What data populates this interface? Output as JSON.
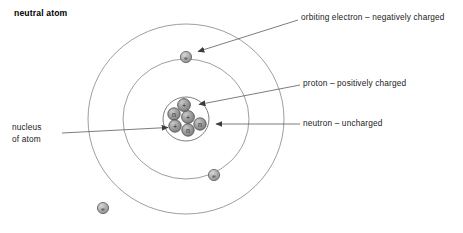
{
  "title": "neutral atom",
  "labels": {
    "electron": "orbiting electron – negatively charged",
    "proton": "proton – positively charged",
    "neutron": "neutron – uncharged",
    "nucleus": "nucleus\nof atom"
  },
  "nucleus_label_line1": "nucleus",
  "nucleus_label_line2": "of atom",
  "diagram": {
    "kind": "bohr-atom-model",
    "center": {
      "x": 186,
      "y": 119
    },
    "orbits": [
      {
        "name": "nucleus-boundary",
        "rx": 23,
        "ry": 22
      },
      {
        "name": "inner-orbit",
        "rx": 63,
        "ry": 60
      },
      {
        "name": "outer-orbit",
        "rx": 98,
        "ry": 95
      }
    ],
    "electrons": [
      {
        "name": "electron-top",
        "x": 186,
        "y": 57,
        "symbol": "e"
      },
      {
        "name": "electron-lower-right",
        "x": 214,
        "y": 175,
        "symbol": "e"
      },
      {
        "name": "electron-lower-left",
        "x": 103,
        "y": 208,
        "symbol": "e"
      }
    ],
    "nucleons": [
      {
        "name": "proton-top",
        "x": 184,
        "y": 105,
        "symbol": "+",
        "type": "proton"
      },
      {
        "name": "neutron-left",
        "x": 174,
        "y": 114,
        "symbol": "n",
        "type": "neutron"
      },
      {
        "name": "proton-center",
        "x": 188,
        "y": 117,
        "symbol": "+",
        "type": "proton"
      },
      {
        "name": "neutron-right",
        "x": 200,
        "y": 124,
        "symbol": "n",
        "type": "neutron"
      },
      {
        "name": "proton-lower-left",
        "x": 175,
        "y": 126,
        "symbol": "+",
        "type": "proton"
      },
      {
        "name": "neutron-bottom",
        "x": 188,
        "y": 130,
        "symbol": "n",
        "type": "neutron"
      }
    ],
    "leader_lines": [
      {
        "name": "electron-leader",
        "x1": 298,
        "y1": 20,
        "x2": 196,
        "y2": 52
      },
      {
        "name": "proton-leader",
        "x1": 300,
        "y1": 85,
        "x2": 197,
        "y2": 105
      },
      {
        "name": "neutron-leader",
        "x1": 300,
        "y1": 124,
        "x2": 214,
        "y2": 124
      },
      {
        "name": "nucleus-leader",
        "x1": 62,
        "y1": 133,
        "x2": 170,
        "y2": 127
      }
    ],
    "counts": {
      "protons": 3,
      "neutrons": 3,
      "electrons": 3
    }
  },
  "colors": {
    "orbit_stroke": "#8c8c8c",
    "nucleus_stroke": "#6f6f6f",
    "particle_fill": "#9a9a9a",
    "particle_stroke": "#4a4a4a",
    "electron_fill": "#ababab",
    "electron_stroke": "#5a5a5a",
    "leader_stroke": "#5c5c5c",
    "text": "#1b1b1b",
    "background": "#ffffff"
  }
}
